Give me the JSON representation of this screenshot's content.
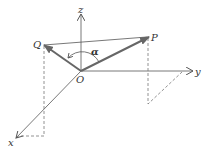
{
  "diagram": {
    "type": "3d-vector-angle",
    "axes": {
      "x": {
        "label": "x"
      },
      "y": {
        "label": "y"
      },
      "z": {
        "label": "z"
      }
    },
    "origin": {
      "label": "O"
    },
    "points": {
      "P": {
        "label": "P"
      },
      "Q": {
        "label": "Q"
      }
    },
    "angle": {
      "label": "α",
      "between": [
        "OP",
        "OQ"
      ]
    },
    "colors": {
      "axis": "#555555",
      "vector": "#666666",
      "dashed": "#777777",
      "text": "#333333"
    }
  }
}
